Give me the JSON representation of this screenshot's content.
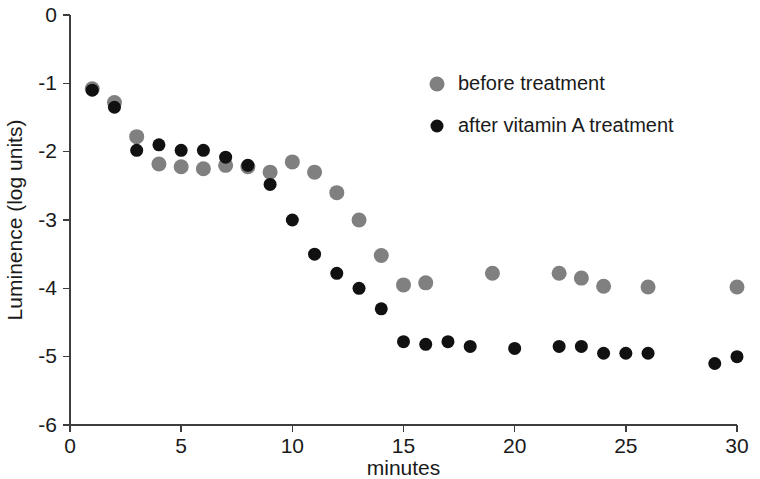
{
  "chart_data": {
    "type": "scatter",
    "title": "",
    "xlabel": "minutes",
    "ylabel": "Luminence (log units)",
    "xlim": [
      0,
      30
    ],
    "ylim": [
      -6,
      0
    ],
    "xticks": [
      0,
      5,
      10,
      15,
      20,
      25,
      30
    ],
    "yticks": [
      0,
      -1,
      -2,
      -3,
      -4,
      -5,
      -6
    ],
    "xtick_labels": [
      "0",
      "5",
      "10",
      "15",
      "20",
      "25",
      "30"
    ],
    "ytick_labels": [
      "0",
      "-1",
      "-2",
      "-3",
      "-4",
      "-5",
      "-6"
    ],
    "grid": false,
    "legend_position": "upper right",
    "series": [
      {
        "name": "before treatment",
        "color": "#808080",
        "marker": "circle",
        "x": [
          1,
          2,
          3,
          4,
          5,
          6,
          7,
          8,
          9,
          10,
          11,
          12,
          13,
          14,
          15,
          16,
          19,
          22,
          23,
          24,
          26,
          30
        ],
        "y": [
          -1.08,
          -1.28,
          -1.78,
          -2.18,
          -2.22,
          -2.25,
          -2.2,
          -2.22,
          -2.3,
          -2.15,
          -2.3,
          -2.6,
          -3.0,
          -3.52,
          -3.95,
          -3.92,
          -3.78,
          -3.78,
          -3.85,
          -3.97,
          -3.98,
          -3.98
        ]
      },
      {
        "name": "after vitamin A treatment",
        "color": "#111111",
        "marker": "circle",
        "x": [
          1,
          2,
          3,
          4,
          5,
          6,
          7,
          8,
          9,
          10,
          11,
          12,
          13,
          14,
          15,
          16,
          17,
          18,
          20,
          22,
          23,
          24,
          25,
          26,
          29,
          30
        ],
        "y": [
          -1.1,
          -1.35,
          -1.98,
          -1.9,
          -1.98,
          -1.98,
          -2.08,
          -2.2,
          -2.48,
          -3.0,
          -3.5,
          -3.78,
          -4.0,
          -4.3,
          -4.78,
          -4.82,
          -4.78,
          -4.85,
          -4.88,
          -4.85,
          -4.85,
          -4.95,
          -4.95,
          -4.95,
          -5.1,
          -5.0
        ]
      }
    ]
  },
  "legend": {
    "entries": [
      {
        "label": "before treatment",
        "color": "#808080"
      },
      {
        "label": "after vitamin A treatment",
        "color": "#111111"
      }
    ]
  },
  "axes": {
    "x_title": "minutes",
    "y_title": "Luminence (log units)"
  }
}
